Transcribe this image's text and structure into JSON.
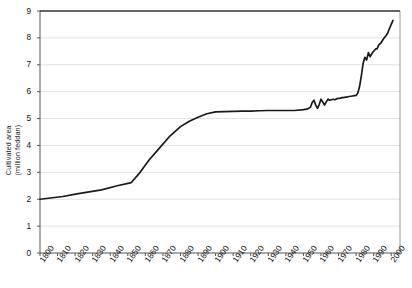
{
  "chart_data": {
    "type": "line",
    "title": "",
    "xlabel": "",
    "ylabel_line1": "Cultivated area",
    "ylabel_line2": "(million feddan)",
    "ylabel": "Cultivated area (million feddan)",
    "grid": true,
    "legend": "none",
    "xlim": [
      1800,
      2005
    ],
    "ylim": [
      0,
      9
    ],
    "ytick_labels": [
      "0",
      "1",
      "2",
      "3",
      "4",
      "5",
      "6",
      "7",
      "8",
      "9"
    ],
    "ytick_values": [
      0,
      1,
      2,
      3,
      4,
      5,
      6,
      7,
      8,
      9
    ],
    "xtick_labels": [
      "1800",
      "1810",
      "1820",
      "1830",
      "1840",
      "1850",
      "1860",
      "1870",
      "1880",
      "1890",
      "1900",
      "1910",
      "1920",
      "1930",
      "1940",
      "1950",
      "1960",
      "1970",
      "1980",
      "1990",
      "2000"
    ],
    "xtick_values": [
      1800,
      1810,
      1820,
      1830,
      1840,
      1850,
      1860,
      1870,
      1880,
      1890,
      1900,
      1910,
      1920,
      1930,
      1940,
      1950,
      1960,
      1970,
      1980,
      1990,
      2000
    ],
    "series": [
      {
        "name": "Cultivated area",
        "color": "#1a1a1a",
        "x": [
          1800,
          1813,
          1821,
          1835,
          1844,
          1852,
          1857,
          1862,
          1868,
          1874,
          1880,
          1885,
          1890,
          1895,
          1900,
          1905,
          1910,
          1915,
          1920,
          1925,
          1930,
          1935,
          1940,
          1945,
          1950,
          1952,
          1954,
          1955,
          1956,
          1957,
          1958,
          1959,
          1960,
          1961,
          1962,
          1963,
          1964,
          1965,
          1966,
          1967,
          1968,
          1969,
          1970,
          1971,
          1972,
          1973,
          1974,
          1975,
          1976,
          1977,
          1978,
          1979,
          1980,
          1981,
          1982,
          1983,
          1984,
          1985,
          1986,
          1987,
          1988,
          1989,
          1990,
          1991,
          1992,
          1993,
          1994,
          1995,
          1996,
          1997,
          1998,
          1999,
          2000,
          2001
        ],
        "values": [
          2.0,
          2.1,
          2.2,
          2.35,
          2.5,
          2.62,
          3.0,
          3.45,
          3.9,
          4.35,
          4.7,
          4.9,
          5.05,
          5.18,
          5.25,
          5.26,
          5.27,
          5.28,
          5.28,
          5.29,
          5.3,
          5.3,
          5.3,
          5.3,
          5.33,
          5.35,
          5.42,
          5.6,
          5.68,
          5.5,
          5.38,
          5.52,
          5.72,
          5.62,
          5.5,
          5.62,
          5.72,
          5.68,
          5.7,
          5.72,
          5.7,
          5.74,
          5.75,
          5.76,
          5.78,
          5.78,
          5.8,
          5.8,
          5.82,
          5.83,
          5.84,
          5.85,
          5.86,
          5.95,
          6.2,
          6.6,
          7.05,
          7.28,
          7.18,
          7.45,
          7.3,
          7.42,
          7.5,
          7.58,
          7.6,
          7.75,
          7.8,
          7.9,
          8.0,
          8.08,
          8.18,
          8.35,
          8.5,
          8.65
        ]
      }
    ]
  }
}
